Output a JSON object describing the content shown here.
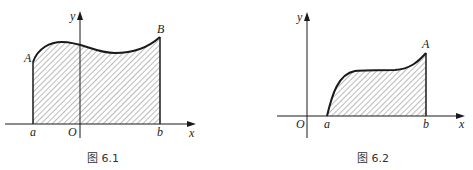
{
  "figures": [
    {
      "caption": "图 6.1",
      "labels": {
        "y": "y",
        "x": "x",
        "origin": "O",
        "a": "a",
        "b": "b",
        "A": "A",
        "B": "B"
      }
    },
    {
      "caption": "图 6.2",
      "labels": {
        "y": "y",
        "x": "x",
        "origin": "O",
        "a": "a",
        "b": "b",
        "A": "A"
      }
    }
  ],
  "colors": {
    "stroke": "#1a1a1a",
    "hatch": "#444444"
  }
}
